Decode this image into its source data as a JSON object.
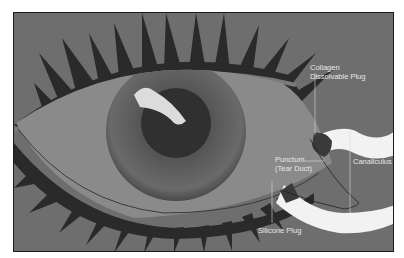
{
  "figure": {
    "labels": {
      "collagen_plug": [
        "Collagen",
        "Dissolvable Plug"
      ],
      "punctum": [
        "Punctum",
        "(Tear Duct)"
      ],
      "canaliculus": "Canaliculus",
      "silicone_plug": "Silicone Plug"
    },
    "colors": {
      "background": "#6e6e6e",
      "lid_dark": "#2a2a2a",
      "sclera": "#8a8a8a",
      "iris": "#555555",
      "pupil": "#303030",
      "duct": "#f2f2f2",
      "label_text": "#e8e8e8"
    }
  }
}
